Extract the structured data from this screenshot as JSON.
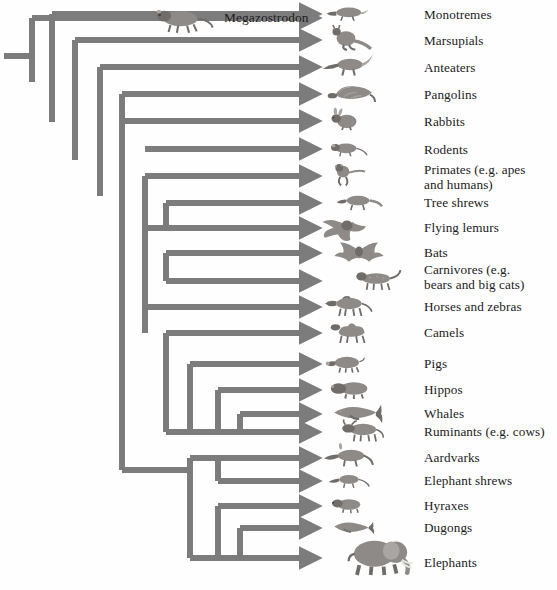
{
  "figure": {
    "kind": "cladogram",
    "title_visible": false,
    "background_color": "#fefefe",
    "branch_color": "#7c7c7c",
    "branch_stroke_px": 6,
    "text_color": "#1b1b1b"
  },
  "fossil": {
    "name": "Megazostrodon",
    "label_x": 224,
    "label_y": 10,
    "icon": "megazostrodon-mammal-icon",
    "icon_x": 146,
    "icon_y": 2,
    "icon_w": 72,
    "icon_h": 32
  },
  "geometry": {
    "root_x": 4,
    "root_y": 56,
    "tip_x": 310,
    "label_x": 424,
    "node_depth_px": [
      4,
      32,
      52,
      75,
      100,
      122,
      145,
      166,
      190,
      218,
      240,
      262,
      284
    ]
  },
  "taxa": [
    {
      "label": "Monotremes",
      "tip_y": 14,
      "label_y": 8,
      "icon": "platypus-icon",
      "icon_x": 318,
      "icon_w": 58,
      "icon_h": 22
    },
    {
      "label": "Marsupials",
      "tip_y": 40,
      "label_y": 34,
      "icon": "kangaroo-icon",
      "icon_x": 318,
      "icon_w": 58,
      "icon_h": 26
    },
    {
      "label": "Anteaters",
      "tip_y": 67,
      "label_y": 61,
      "icon": "anteater-icon",
      "icon_x": 316,
      "icon_w": 62,
      "icon_h": 26
    },
    {
      "label": "Pangolins",
      "tip_y": 94,
      "label_y": 88,
      "icon": "pangolin-icon",
      "icon_x": 316,
      "icon_w": 66,
      "icon_h": 26
    },
    {
      "label": "Rabbits",
      "tip_y": 121,
      "label_y": 115,
      "icon": "rabbit-icon",
      "icon_x": 320,
      "icon_w": 48,
      "icon_h": 26
    },
    {
      "label": "Rodents",
      "tip_y": 149,
      "label_y": 143,
      "icon": "mouse-icon",
      "icon_x": 318,
      "icon_w": 56,
      "icon_h": 22
    },
    {
      "label": "Primates (e.g. apes\nand humans)",
      "tip_y": 176,
      "label_y": 163,
      "icon": "monkey-icon",
      "icon_x": 320,
      "icon_w": 48,
      "icon_h": 32
    },
    {
      "label": "Tree shrews",
      "tip_y": 203,
      "label_y": 196,
      "icon": "tree-shrew-icon",
      "icon_x": 330,
      "icon_w": 58,
      "icon_h": 24
    },
    {
      "label": "Flying lemurs",
      "tip_y": 228,
      "label_y": 221,
      "icon": "flying-lemur-icon",
      "icon_x": 318,
      "icon_w": 58,
      "icon_h": 28
    },
    {
      "label": "Bats",
      "tip_y": 253,
      "label_y": 246,
      "icon": "bat-icon",
      "icon_x": 328,
      "icon_w": 62,
      "icon_h": 28
    },
    {
      "label": "Carnivores (e.g.\nbears and big cats)",
      "tip_y": 281,
      "label_y": 263,
      "icon": "big-cat-icon",
      "icon_x": 344,
      "icon_w": 62,
      "icon_h": 26
    },
    {
      "label": "Horses and zebras",
      "tip_y": 307,
      "label_y": 300,
      "icon": "zebra-icon",
      "icon_x": 318,
      "icon_w": 60,
      "icon_h": 26
    },
    {
      "label": "Camels",
      "tip_y": 333,
      "label_y": 326,
      "icon": "camel-icon",
      "icon_x": 324,
      "icon_w": 52,
      "icon_h": 28
    },
    {
      "label": "Pigs",
      "tip_y": 364,
      "label_y": 357,
      "icon": "pig-icon",
      "icon_x": 318,
      "icon_w": 56,
      "icon_h": 24
    },
    {
      "label": "Hippos",
      "tip_y": 390,
      "label_y": 383,
      "icon": "hippo-icon",
      "icon_x": 320,
      "icon_w": 62,
      "icon_h": 24
    },
    {
      "label": "Whales",
      "tip_y": 414,
      "label_y": 407,
      "icon": "whale-icon",
      "icon_x": 316,
      "icon_w": 78,
      "icon_h": 26
    },
    {
      "label": "Ruminants (e.g. cows)",
      "tip_y": 432,
      "label_y": 425,
      "icon": "cow-icon",
      "icon_x": 330,
      "icon_w": 62,
      "icon_h": 26
    },
    {
      "label": "Aardvarks",
      "tip_y": 458,
      "label_y": 451,
      "icon": "aardvark-icon",
      "icon_x": 318,
      "icon_w": 60,
      "icon_h": 26
    },
    {
      "label": "Elephant shrews",
      "tip_y": 481,
      "label_y": 474,
      "icon": "elephant-shrew-icon",
      "icon_x": 324,
      "icon_w": 50,
      "icon_h": 22
    },
    {
      "label": "Hyraxes",
      "tip_y": 506,
      "label_y": 499,
      "icon": "hyrax-icon",
      "icon_x": 322,
      "icon_w": 52,
      "icon_h": 22
    },
    {
      "label": "Dugongs",
      "tip_y": 528,
      "label_y": 521,
      "icon": "dugong-icon",
      "icon_x": 318,
      "icon_w": 66,
      "icon_h": 22
    },
    {
      "label": "Elephants",
      "tip_y": 558,
      "label_y": 556,
      "icon": "elephant-icon",
      "icon_x": 338,
      "icon_w": 76,
      "icon_h": 50
    }
  ],
  "chart_data": {
    "type": "diagram",
    "diagram_type": "phylogenetic-cladogram",
    "outgroup": "Megazostrodon",
    "tip_order": [
      "Monotremes",
      "Marsupials",
      "Anteaters",
      "Pangolins",
      "Rabbits",
      "Rodents",
      "Primates (e.g. apes and humans)",
      "Tree shrews",
      "Flying lemurs",
      "Bats",
      "Carnivores (e.g. bears and big cats)",
      "Horses and zebras",
      "Camels",
      "Pigs",
      "Hippos",
      "Whales",
      "Ruminants (e.g. cows)",
      "Aardvarks",
      "Elephant shrews",
      "Hyraxes",
      "Dugongs",
      "Elephants"
    ],
    "tip_count": 22,
    "clades": [
      {
        "name": "euarchonta",
        "members": [
          "Primates (e.g. apes and humans)",
          "Tree shrews",
          "Flying lemurs"
        ]
      },
      {
        "name": "laurasiatheria-carnivora-chiroptera",
        "members": [
          "Bats",
          "Carnivores (e.g. bears and big cats)"
        ]
      },
      {
        "name": "cetartiodactyla",
        "members": [
          "Camels",
          "Pigs",
          "Hippos",
          "Whales",
          "Ruminants (e.g. cows)"
        ]
      },
      {
        "name": "whippomorpha",
        "members": [
          "Hippos",
          "Whales"
        ]
      },
      {
        "name": "afrotheria",
        "members": [
          "Aardvarks",
          "Elephant shrews",
          "Hyraxes",
          "Dugongs",
          "Elephants"
        ]
      },
      {
        "name": "paenungulata",
        "members": [
          "Hyraxes",
          "Dugongs",
          "Elephants"
        ]
      },
      {
        "name": "tethytheria",
        "members": [
          "Dugongs",
          "Elephants"
        ]
      }
    ],
    "axis": "implied geological time, increasing left to right",
    "grid": false,
    "legend": "none"
  }
}
